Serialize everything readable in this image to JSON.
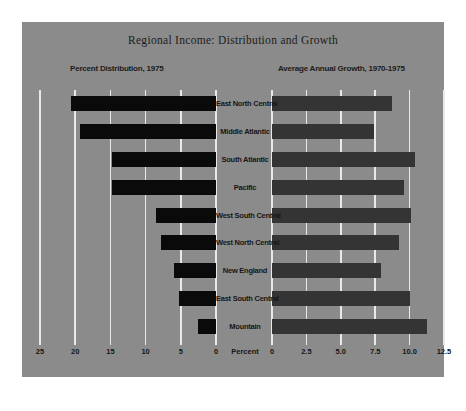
{
  "chart_data": {
    "type": "bar",
    "title": "Regional Income: Distribution and Growth",
    "orientation": "horizontal",
    "layout": "two-panel mirrored bar chart (back-to-back) with shared centered category labels",
    "grid": true,
    "legend": "none",
    "categories": [
      "East North Central",
      "Middle Atlantic",
      "South Atlantic",
      "Pacific",
      "West South Central",
      "West North Central",
      "New England",
      "East South Central",
      "Mountain"
    ],
    "panels": [
      {
        "name": "left",
        "subtitle": "Percent Distribution, 1975",
        "xlabel": "Percent",
        "direction": "right-to-left",
        "xlim": [
          25,
          0
        ],
        "ticks": [
          "25",
          "20",
          "15",
          "10",
          "5",
          "0"
        ],
        "tick_values": [
          25,
          20,
          15,
          10,
          5,
          0
        ],
        "bar_color": "#0a0a0a",
        "values": [
          20.6,
          19.3,
          14.8,
          14.8,
          8.5,
          7.8,
          6.0,
          5.2,
          2.6
        ]
      },
      {
        "name": "right",
        "subtitle": "Average Annual Growth, 1970-1975",
        "xlabel": "",
        "direction": "left-to-right",
        "xlim": [
          0,
          12.5
        ],
        "ticks": [
          "0",
          "2.5",
          "5.0",
          "7.5",
          "10.0",
          "12.5"
        ],
        "tick_values": [
          0,
          2.5,
          5.0,
          7.5,
          10.0,
          12.5
        ],
        "bar_color": "#343434",
        "values": [
          8.7,
          7.4,
          10.4,
          9.6,
          10.1,
          9.2,
          7.9,
          10.0,
          11.3
        ]
      }
    ]
  },
  "colors": {
    "panel_background": "#8b8b8b",
    "page_background": "#ffffff",
    "gridline": "#e9e9e9",
    "text": "#161616",
    "bar_left": "#0a0a0a",
    "bar_right": "#343434"
  }
}
